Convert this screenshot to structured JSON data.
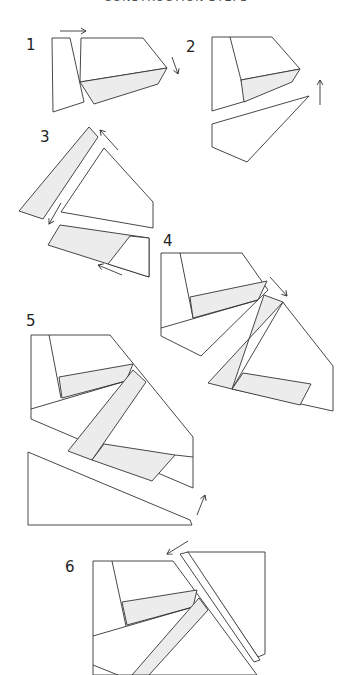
{
  "heading": "CONSTRUCTION STEPS",
  "colors": {
    "stroke": "#333333",
    "fill_white": "#ffffff",
    "fill_shaded": "#ececec"
  },
  "steps": [
    {
      "label": "1",
      "label_pos": [
        26,
        50
      ],
      "polygons": [
        {
          "pts": "52,38 70,38 84,102 53,112",
          "shaded": false
        },
        {
          "pts": "81,38 143,38 167,68 80,82",
          "shaded": false
        },
        {
          "pts": "80,82 167,68 158,84 94,104",
          "shaded": true
        }
      ],
      "arrows": [
        {
          "d": "M60,31 L86,31",
          "head": [
            86,
            31,
            0
          ]
        },
        {
          "d": "M172,57 L178,74",
          "head": [
            178,
            74,
            70
          ]
        }
      ]
    },
    {
      "label": "2",
      "label_pos": [
        186,
        52
      ],
      "polygons": [
        {
          "pts": "212,37 272,37 300,69 241,80 246,101 212,111",
          "shaded": false
        },
        {
          "pts": "230,37 241,80",
          "line": true
        },
        {
          "pts": "241,80 300,69 292,82 244,102",
          "shaded": true
        },
        {
          "pts": "212,124 309,96 247,162 212,147",
          "shaded": false
        }
      ],
      "arrows": [
        {
          "d": "M320,105 L320,80",
          "head": [
            320,
            80,
            -90
          ]
        }
      ]
    },
    {
      "label": "3",
      "label_pos": [
        40,
        142
      ],
      "polygons": [
        {
          "pts": "19,211 89,127 98,137 43,219",
          "shaded": true
        },
        {
          "pts": "104,148 153,202 153,228 61,212",
          "shaded": false
        },
        {
          "pts": "60,225 149,238 149,277 48,245",
          "shaded": true
        },
        {
          "pts": "130,236 149,238 149,277 108,264",
          "shaded": false
        }
      ],
      "arrows": [
        {
          "d": "M118,150 L100,130",
          "head": [
            100,
            130,
            -132
          ]
        },
        {
          "d": "M61,203 L49,224",
          "head": [
            49,
            224,
            120
          ]
        },
        {
          "d": "M122,275 L98,265",
          "head": [
            98,
            265,
            200
          ]
        }
      ]
    },
    {
      "label": "4",
      "label_pos": [
        163,
        246
      ],
      "polygons": [
        {
          "pts": "161,253 242,253 268,290 201,356 161,336",
          "shaded": false
        },
        {
          "pts": "180,253 193,318",
          "line": true
        },
        {
          "pts": "190,297 267,281 258,300 193,318",
          "shaded": true
        },
        {
          "pts": "161,328 258,300",
          "line": true
        },
        {
          "pts": "264,295 283,302 208,383 232,389",
          "shaded": true
        },
        {
          "pts": "285,305 333,366 333,411 232,389 283,302",
          "shaded": false
        },
        {
          "pts": "243,373 311,384 300,405 232,389",
          "shaded": true
        }
      ],
      "arrows": [
        {
          "d": "M270,277 L287,296",
          "head": [
            287,
            296,
            48
          ]
        }
      ]
    },
    {
      "label": "5",
      "label_pos": [
        26,
        326
      ],
      "polygons": [
        {
          "pts": "31,335 110,335 193,437 193,488 31,419",
          "shaded": false
        },
        {
          "pts": "49,335 61,398",
          "line": true
        },
        {
          "pts": "59,377 133,364 126,381 62,398",
          "shaded": true
        },
        {
          "pts": "31,409 126,381",
          "line": true
        },
        {
          "pts": "133,370 146,382 92,460 68,451",
          "shaded": true
        },
        {
          "pts": "104,444 175,455 152,481 92,460",
          "shaded": true
        },
        {
          "pts": "175,455 193,457",
          "line": true
        },
        {
          "pts": "28,452 190,520 192,525 28,525",
          "shaded": false
        }
      ],
      "arrows": [
        {
          "d": "M197,515 L205,495",
          "head": [
            205,
            495,
            -70
          ]
        }
      ]
    },
    {
      "label": "6",
      "label_pos": [
        65,
        572
      ],
      "polygons": [
        {
          "pts": "93,561 173,561 257,675 93,675",
          "shaded": false
        },
        {
          "pts": "112,561 126,626",
          "line": true
        },
        {
          "pts": "122,602 197,590 193,607 127,625",
          "shaded": true
        },
        {
          "pts": "93,636 193,607",
          "line": true
        },
        {
          "pts": "199,598 208,610 149,675 132,675",
          "shaded": true
        },
        {
          "pts": "93,665 118,675",
          "line": true
        },
        {
          "pts": "187,552 265,552 265,652 265,654 258,657",
          "shaded": false
        },
        {
          "pts": "180,554 188,552 260,660 254,662",
          "shaded": false
        }
      ],
      "arrows": [
        {
          "d": "M188,541 L167,554",
          "head": [
            167,
            554,
            150
          ]
        }
      ]
    }
  ]
}
